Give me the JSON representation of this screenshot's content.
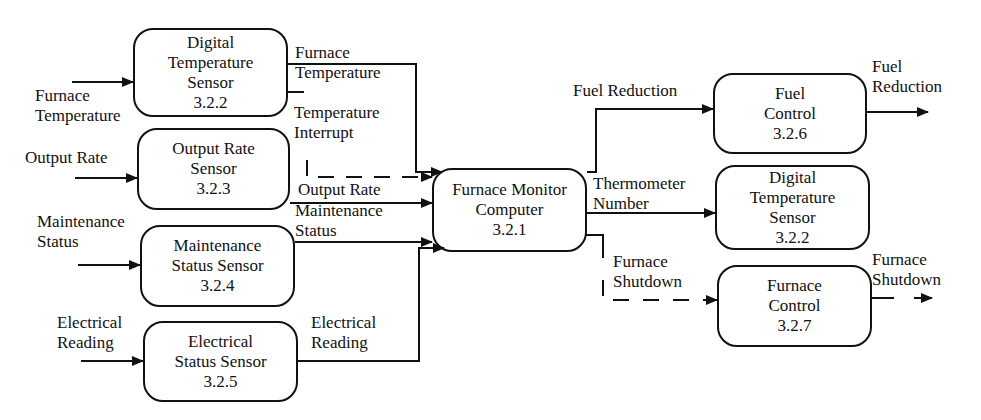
{
  "diagram": {
    "type": "data-flow",
    "processes": [
      {
        "id": "3.2.2a",
        "lines": [
          "Digital",
          "Temperature",
          "Sensor",
          "3.2.2"
        ]
      },
      {
        "id": "3.2.3",
        "lines": [
          "Output Rate",
          "Sensor",
          "3.2.3"
        ]
      },
      {
        "id": "3.2.4",
        "lines": [
          "Maintenance",
          "Status Sensor",
          "3.2.4"
        ]
      },
      {
        "id": "3.2.5",
        "lines": [
          "Electrical",
          "Status Sensor",
          "3.2.5"
        ]
      },
      {
        "id": "3.2.1",
        "lines": [
          "Furnace Monitor",
          "Computer",
          "3.2.1"
        ]
      },
      {
        "id": "3.2.6",
        "lines": [
          "Fuel",
          "Control",
          "3.2.6"
        ]
      },
      {
        "id": "3.2.2b",
        "lines": [
          "Digital",
          "Temperature",
          "Sensor",
          "3.2.2"
        ]
      },
      {
        "id": "3.2.7",
        "lines": [
          "Furnace",
          "Control",
          "3.2.7"
        ]
      }
    ],
    "flows": [
      {
        "id": "in-furnace-temp",
        "lines": [
          "Furnace",
          "Temperature"
        ],
        "style": "solid"
      },
      {
        "id": "in-output-rate",
        "lines": [
          "Output Rate"
        ],
        "style": "solid"
      },
      {
        "id": "in-maintenance",
        "lines": [
          "Maintenance",
          "Status"
        ],
        "style": "solid"
      },
      {
        "id": "in-electrical",
        "lines": [
          "Electrical",
          "Reading"
        ],
        "style": "solid"
      },
      {
        "id": "furnace-temp",
        "lines": [
          "Furnace",
          "Temperature"
        ],
        "style": "solid"
      },
      {
        "id": "temp-interrupt",
        "lines": [
          "Temperature",
          "Interrupt"
        ],
        "style": "dashed"
      },
      {
        "id": "output-rate",
        "lines": [
          "Output Rate"
        ],
        "style": "solid"
      },
      {
        "id": "maintenance-status",
        "lines": [
          "Maintenance",
          "Status"
        ],
        "style": "solid"
      },
      {
        "id": "electrical-reading",
        "lines": [
          "Electrical",
          "Reading"
        ],
        "style": "solid"
      },
      {
        "id": "fuel-reduction",
        "lines": [
          "Fuel Reduction"
        ],
        "style": "solid"
      },
      {
        "id": "thermometer-number",
        "lines": [
          "Thermometer",
          "Number"
        ],
        "style": "solid"
      },
      {
        "id": "furnace-shutdown",
        "lines": [
          "Furnace",
          "Shutdown"
        ],
        "style": "dashed"
      },
      {
        "id": "out-fuel-reduction",
        "lines": [
          "Fuel",
          "Reduction"
        ],
        "style": "solid"
      },
      {
        "id": "out-furnace-shutdown",
        "lines": [
          "Furnace",
          "Shutdown"
        ],
        "style": "dashed"
      }
    ]
  }
}
